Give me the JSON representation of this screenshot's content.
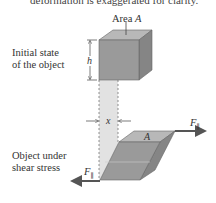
{
  "caption_partial": "deformation is exaggerated for clarity.",
  "labels": {
    "area": "Area",
    "area_symbol": "A",
    "initial_state_line1": "Initial state",
    "initial_state_line2": "of the object",
    "height_symbol": "h",
    "displacement_symbol": "x",
    "sheared_line1": "Object under",
    "sheared_line2": "shear stress",
    "top_area_symbol": "A",
    "force_symbol": "F",
    "force_subscript": "∥"
  },
  "colors": {
    "cube_front": "#9a9a9a",
    "cube_top": "#b8b8b8",
    "cube_side": "#858585",
    "ghost_column": "#e2e2e2",
    "arrow": "#555555"
  }
}
